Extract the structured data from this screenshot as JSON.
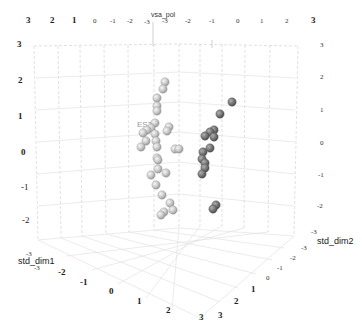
{
  "chart_data": {
    "type": "scatter",
    "subtype": "3d-scatter",
    "title": "",
    "axes": {
      "z": {
        "label": "vsa_pol",
        "ticks": [
          "-3",
          "-2",
          "-1",
          "0",
          "1",
          "2",
          "3"
        ],
        "range": [
          -3,
          3
        ]
      },
      "x": {
        "label": "std_dim1",
        "ticks": [
          "-3",
          "-2",
          "-1",
          "0",
          "1",
          "2",
          "3"
        ],
        "range": [
          -3,
          3
        ]
      },
      "y": {
        "label": "std_dim2",
        "ticks": [
          "-3",
          "-2",
          "-1",
          "0",
          "1",
          "2",
          "3"
        ],
        "range": [
          -3,
          3
        ]
      }
    },
    "top_ticks_left": [
      "3",
      "2",
      "1",
      "0",
      "-1",
      "-2",
      "-3"
    ],
    "top_ticks_right": [
      "-3",
      "-2",
      "-1",
      "0",
      "1",
      "2",
      "3"
    ],
    "left_z_ticks": [
      "3",
      "2",
      "1",
      "0",
      "-1",
      "-2",
      "-3"
    ],
    "right_z_ticks": [
      "3",
      "2",
      "1",
      "0",
      "-1",
      "-2",
      "-3"
    ],
    "bottom_x_ticks": [
      "-3",
      "-2",
      "-1",
      "0",
      "1",
      "2",
      "3"
    ],
    "bottom_y_ticks": [
      "3",
      "2",
      "1",
      "0",
      "-1",
      "-2",
      "-3"
    ],
    "annotations": [
      {
        "text": "EST",
        "x": 137,
        "y": 124
      }
    ],
    "grid": true,
    "legend": null,
    "series": [
      {
        "name": "cluster-light",
        "color": "#c8c8c8",
        "points_screen": [
          [
            165,
            82
          ],
          [
            163,
            89
          ],
          [
            157,
            98
          ],
          [
            157,
            106
          ],
          [
            157,
            111
          ],
          [
            155,
            123
          ],
          [
            151,
            128
          ],
          [
            147,
            130
          ],
          [
            143,
            133
          ],
          [
            169,
            127
          ],
          [
            167,
            131
          ],
          [
            155,
            134
          ],
          [
            156,
            141
          ],
          [
            146,
            141
          ],
          [
            141,
            147
          ],
          [
            157,
            147
          ],
          [
            175,
            149
          ],
          [
            179,
            149
          ],
          [
            157,
            158
          ],
          [
            158,
            160
          ],
          [
            158,
            169
          ],
          [
            151,
            175
          ],
          [
            166,
            173
          ],
          [
            156,
            185
          ],
          [
            162,
            195
          ],
          [
            170,
            203
          ],
          [
            164,
            212
          ],
          [
            161,
            215
          ],
          [
            173,
            210
          ]
        ]
      },
      {
        "name": "cluster-dark",
        "color": "#7a7a7a",
        "points_screen": [
          [
            232,
            102
          ],
          [
            220,
            114
          ],
          [
            214,
            130
          ],
          [
            210,
            132
          ],
          [
            205,
            136
          ],
          [
            214,
            137
          ],
          [
            210,
            148
          ],
          [
            203,
            152
          ],
          [
            202,
            159
          ],
          [
            205,
            163
          ],
          [
            205,
            168
          ],
          [
            202,
            174
          ],
          [
            216,
            205
          ],
          [
            213,
            209
          ]
        ]
      }
    ]
  }
}
